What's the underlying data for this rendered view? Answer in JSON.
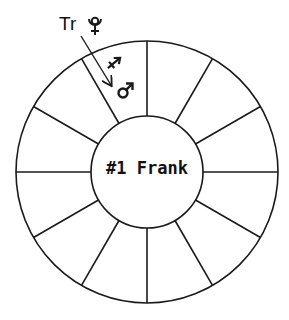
{
  "chart": {
    "center_label": "#1 Frank",
    "houses": 12,
    "transit": {
      "label": "Tr",
      "planet": "pluto-icon",
      "arrow_to_sign": "sagittarius-icon",
      "target_planet": "mars-icon"
    }
  },
  "colors": {
    "line": "#1a1a1a",
    "background": "#ffffff"
  }
}
